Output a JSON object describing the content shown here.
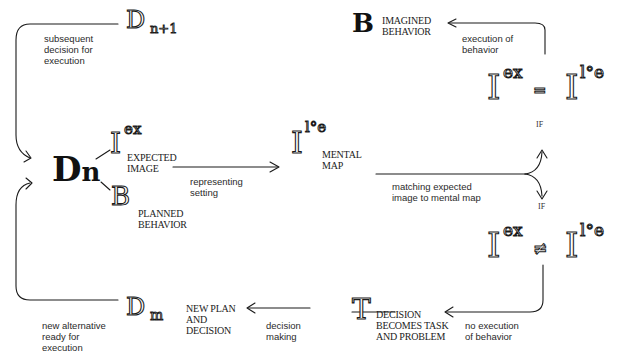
{
  "diagram": {
    "type": "decision-cycle flow diagram",
    "nodes": {
      "dn": {
        "symbol": "D",
        "subscript": "n"
      },
      "dn_plus_1": {
        "symbol": "D",
        "subscript": "n+1"
      },
      "dm": {
        "symbol": "D",
        "subscript": "m"
      },
      "expected_image": {
        "symbol": "I",
        "superscript": "ex",
        "label_line1": "EXPECTED",
        "label_line2": "IMAGE"
      },
      "planned_behavior": {
        "symbol": "B",
        "label_line1": "PLANNED",
        "label_line2": "BEHAVIOR"
      },
      "mental_map": {
        "symbol": "I",
        "superscript": "l°e",
        "label_line1": "MENTAL",
        "label_line2": "MAP"
      },
      "imagined_behavior": {
        "symbol": "B",
        "label_line1": "IMAGINED",
        "label_line2": "BEHAVIOR"
      },
      "match_equal": {
        "left_symbol": "I",
        "left_sup": "ex",
        "operator": "=",
        "right_symbol": "I",
        "right_sup": "l°e",
        "condition": "IF"
      },
      "match_not_equal": {
        "left_symbol": "I",
        "left_sup": "ex",
        "operator": "≠",
        "right_symbol": "I",
        "right_sup": "l°e",
        "condition": "IF"
      },
      "task": {
        "symbol": "T",
        "label_line1": "DECISION",
        "label_line2": "BECOMES TASK",
        "label_line3": "AND PROBLEM"
      },
      "new_plan": {
        "label_line1": "NEW PLAN",
        "label_line2": "AND",
        "label_line3": "DECISION"
      }
    },
    "edges": {
      "subsequent": {
        "line1": "subsequent",
        "line2": "decision for",
        "line3": "execution"
      },
      "representing": {
        "line1": "representing",
        "line2": "setting"
      },
      "matching": {
        "line1": "matching expected",
        "line2": "image to mental map"
      },
      "execution": {
        "line1": "execution of",
        "line2": "behavior"
      },
      "no_execution": {
        "line1": "no execution",
        "line2": "of behavior"
      },
      "decision_making": {
        "line1": "decision",
        "line2": "making"
      },
      "new_alternative": {
        "line1": "new alternative",
        "line2": "ready for",
        "line3": "execution"
      }
    }
  }
}
